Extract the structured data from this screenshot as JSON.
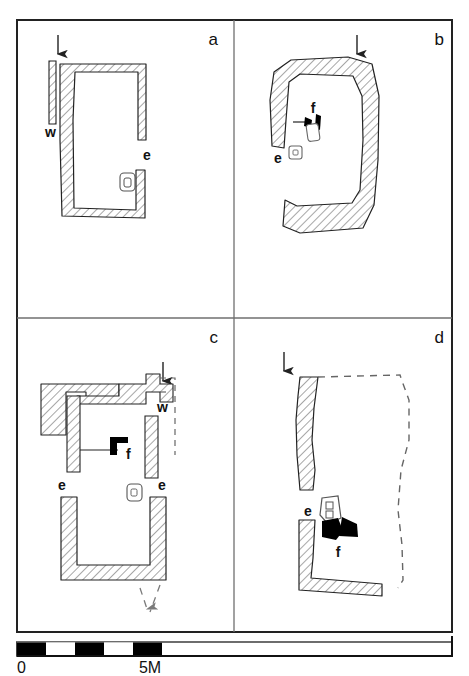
{
  "figure": {
    "panels": [
      {
        "id": "a",
        "label": "a",
        "features": [
          {
            "key": "w",
            "label": "w",
            "meaning": "wall-stub"
          },
          {
            "key": "e",
            "label": "e",
            "meaning": "entrance"
          }
        ],
        "has_entry_arrow": true,
        "has_dashed_reconstruction": false,
        "has_hearth": false,
        "small_feature_count": 1
      },
      {
        "id": "b",
        "label": "b",
        "features": [
          {
            "key": "f",
            "label": "f",
            "meaning": "hearth"
          },
          {
            "key": "e",
            "label": "e",
            "meaning": "entrance"
          }
        ],
        "has_entry_arrow": true,
        "has_dashed_reconstruction": false,
        "has_hearth": true,
        "small_feature_count": 2
      },
      {
        "id": "c",
        "label": "c",
        "features": [
          {
            "key": "w",
            "label": "w",
            "meaning": "wall-stub"
          },
          {
            "key": "f",
            "label": "f",
            "meaning": "hearth"
          },
          {
            "key": "e1",
            "label": "e",
            "meaning": "entrance"
          },
          {
            "key": "e2",
            "label": "e",
            "meaning": "entrance"
          }
        ],
        "has_entry_arrow": true,
        "has_dashed_reconstruction": true,
        "has_exit_arrow": true,
        "has_hearth": true,
        "small_feature_count": 1
      },
      {
        "id": "d",
        "label": "d",
        "features": [
          {
            "key": "e",
            "label": "e",
            "meaning": "entrance"
          },
          {
            "key": "f",
            "label": "f",
            "meaning": "hearth"
          }
        ],
        "has_entry_arrow": true,
        "has_dashed_reconstruction": true,
        "has_hearth": true,
        "small_feature_count": 1
      }
    ]
  },
  "scale": {
    "start_label": "0",
    "end_label": "5M",
    "segments": 5,
    "segment_colors": [
      "#000000",
      "#ffffff",
      "#000000",
      "#ffffff",
      "#000000"
    ]
  },
  "colors": {
    "ink": "#111111",
    "hatch": "#777777",
    "frame": "#222222",
    "fill": "#000000",
    "paper": "#ffffff"
  }
}
